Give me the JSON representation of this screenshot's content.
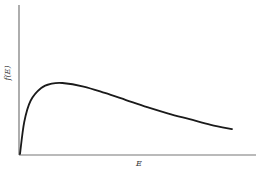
{
  "chart_data": {
    "type": "line",
    "title": "",
    "xlabel": "E",
    "ylabel": "f(E)",
    "grid": false,
    "legend": null,
    "x_ticks": [],
    "y_ticks": [],
    "series": [
      {
        "name": "f(E)",
        "x": [
          0,
          0.02,
          0.05,
          0.1,
          0.15,
          0.2,
          0.3,
          0.4,
          0.5,
          0.6,
          0.7,
          0.8,
          0.9,
          1.0
        ],
        "values": [
          0,
          0.45,
          0.75,
          0.93,
          0.99,
          1.0,
          0.95,
          0.86,
          0.76,
          0.66,
          0.57,
          0.49,
          0.41,
          0.35
        ]
      }
    ],
    "xlim": [
      0,
      1.1
    ],
    "ylim": [
      0,
      2.1
    ]
  },
  "colors": {
    "axis": "#777777",
    "curve": "#1a1a1a",
    "background": "#ffffff"
  }
}
